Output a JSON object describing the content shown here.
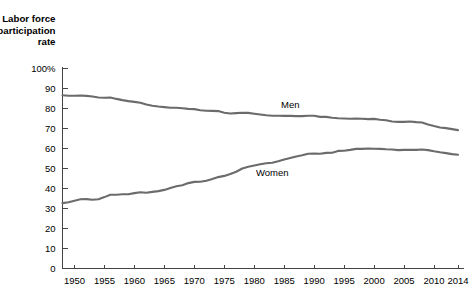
{
  "chart_data": {
    "type": "line",
    "title": "",
    "axis_title_lines": [
      "Labor force",
      "participation",
      "rate"
    ],
    "xlabel": "",
    "ylabel": "Labor force participation rate",
    "ylim": [
      0,
      100
    ],
    "xlim": [
      1948,
      2014
    ],
    "grid": false,
    "legend_position": "inline",
    "y_ticks": [
      0,
      10,
      20,
      30,
      40,
      50,
      60,
      70,
      80,
      90,
      100
    ],
    "y_tick_labels": [
      "0",
      "10",
      "20",
      "30",
      "40",
      "50",
      "60",
      "70",
      "80",
      "90",
      "100%"
    ],
    "x_ticks": [
      1950,
      1955,
      1960,
      1965,
      1970,
      1975,
      1980,
      1985,
      1990,
      1995,
      2000,
      2005,
      2010,
      2014
    ],
    "x_tick_labels": [
      "1950",
      "1955",
      "1960",
      "1965",
      "1970",
      "1975",
      "1980",
      "1985",
      "1990",
      "1995",
      "2000",
      "2005",
      "2010",
      "2014"
    ],
    "line_color": "#6b6b6b",
    "series": [
      {
        "name": "Men",
        "label": "Men",
        "label_x": 1986,
        "label_y": 80.5,
        "color": "#6b6b6b",
        "x": [
          1948,
          1949,
          1950,
          1951,
          1952,
          1953,
          1954,
          1955,
          1956,
          1957,
          1958,
          1959,
          1960,
          1961,
          1962,
          1963,
          1964,
          1965,
          1966,
          1967,
          1968,
          1969,
          1970,
          1971,
          1972,
          1973,
          1974,
          1975,
          1976,
          1977,
          1978,
          1979,
          1980,
          1981,
          1982,
          1983,
          1984,
          1985,
          1986,
          1987,
          1988,
          1989,
          1990,
          1991,
          1992,
          1993,
          1994,
          1995,
          1996,
          1997,
          1998,
          1999,
          2000,
          2001,
          2002,
          2003,
          2004,
          2005,
          2006,
          2007,
          2008,
          2009,
          2010,
          2011,
          2012,
          2013,
          2014
        ],
        "values": [
          86.6,
          86.4,
          86.4,
          86.5,
          86.3,
          86.0,
          85.5,
          85.4,
          85.5,
          84.8,
          84.2,
          83.7,
          83.3,
          82.9,
          82.0,
          81.4,
          81.0,
          80.7,
          80.4,
          80.4,
          80.1,
          79.8,
          79.7,
          79.1,
          78.9,
          78.8,
          78.7,
          77.9,
          77.5,
          77.7,
          77.9,
          77.8,
          77.4,
          77.0,
          76.6,
          76.4,
          76.4,
          76.3,
          76.3,
          76.2,
          76.2,
          76.4,
          76.4,
          75.8,
          75.8,
          75.4,
          75.1,
          75.0,
          74.9,
          75.0,
          74.9,
          74.7,
          74.8,
          74.4,
          74.1,
          73.5,
          73.3,
          73.3,
          73.5,
          73.2,
          73.0,
          72.0,
          71.2,
          70.5,
          70.2,
          69.7,
          69.2
        ]
      },
      {
        "name": "Women",
        "label": "Women",
        "label_x": 1983,
        "label_y": 46.5,
        "color": "#6b6b6b",
        "x": [
          1948,
          1949,
          1950,
          1951,
          1952,
          1953,
          1954,
          1955,
          1956,
          1957,
          1958,
          1959,
          1960,
          1961,
          1962,
          1963,
          1964,
          1965,
          1966,
          1967,
          1968,
          1969,
          1970,
          1971,
          1972,
          1973,
          1974,
          1975,
          1976,
          1977,
          1978,
          1979,
          1980,
          1981,
          1982,
          1983,
          1984,
          1985,
          1986,
          1987,
          1988,
          1989,
          1990,
          1991,
          1992,
          1993,
          1994,
          1995,
          1996,
          1997,
          1998,
          1999,
          2000,
          2001,
          2002,
          2003,
          2004,
          2005,
          2006,
          2007,
          2008,
          2009,
          2010,
          2011,
          2012,
          2013,
          2014
        ],
        "values": [
          32.7,
          33.1,
          33.9,
          34.6,
          34.7,
          34.4,
          34.6,
          35.7,
          36.9,
          36.9,
          37.1,
          37.1,
          37.7,
          38.1,
          37.9,
          38.3,
          38.7,
          39.3,
          40.3,
          41.1,
          41.6,
          42.7,
          43.3,
          43.4,
          43.9,
          44.7,
          45.7,
          46.3,
          47.3,
          48.4,
          50.0,
          50.9,
          51.5,
          52.1,
          52.6,
          52.9,
          53.6,
          54.5,
          55.3,
          56.0,
          56.6,
          57.4,
          57.5,
          57.4,
          57.8,
          57.9,
          58.8,
          58.9,
          59.3,
          59.8,
          59.8,
          60.0,
          59.9,
          59.8,
          59.6,
          59.5,
          59.2,
          59.3,
          59.4,
          59.3,
          59.5,
          59.2,
          58.6,
          58.1,
          57.7,
          57.2,
          56.9
        ]
      }
    ]
  }
}
